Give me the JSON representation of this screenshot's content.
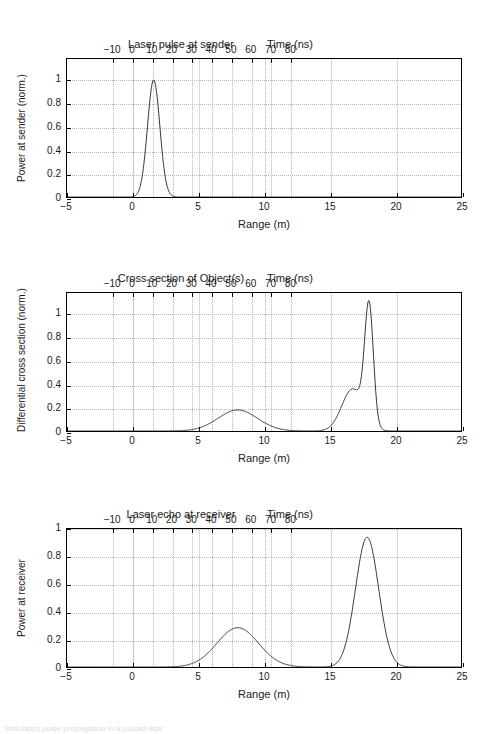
{
  "figure": {
    "caption_fragment": "Simulated pulse propagation in a pulsed lidar"
  },
  "panels": [
    {
      "id": "panel-sender",
      "title": "Laser pulse at sender",
      "top_axis_label": "Time (ns)",
      "bottom_axis_label": "Range (m)",
      "ylabel": "Power at sender (norm.)",
      "top_ticks": [
        "-10",
        "0",
        "10",
        "20",
        "30",
        "40",
        "50",
        "60",
        "70",
        "80"
      ],
      "bottom_ticks": [
        "-5",
        "0",
        "5",
        "10",
        "15",
        "20",
        "25"
      ],
      "y_ticks": [
        "0",
        "0.2",
        "0.4",
        "0.6",
        "0.8",
        "1"
      ]
    },
    {
      "id": "panel-cross-section",
      "title": "Cross section of Object(s)",
      "top_axis_label": "Time (ns)",
      "bottom_axis_label": "Range (m)",
      "ylabel": "Differential cross section (norm.)",
      "top_ticks": [
        "-10",
        "0",
        "10",
        "20",
        "30",
        "40",
        "50",
        "60",
        "70",
        "80"
      ],
      "bottom_ticks": [
        "-5",
        "0",
        "5",
        "10",
        "15",
        "20",
        "25"
      ],
      "y_ticks": [
        "0",
        "0.2",
        "0.4",
        "0.6",
        "0.8",
        "1"
      ]
    },
    {
      "id": "panel-receiver",
      "title": "Laser echo at receiver",
      "top_axis_label": "Time (ns)",
      "bottom_axis_label": "Range (m)",
      "ylabel": "Power at receiver",
      "top_ticks": [
        "-10",
        "0",
        "10",
        "20",
        "30",
        "40",
        "50",
        "60",
        "70",
        "80"
      ],
      "bottom_ticks": [
        "-5",
        "0",
        "5",
        "10",
        "15",
        "20",
        "25"
      ],
      "y_ticks": [
        "0",
        "0.2",
        "0.4",
        "0.6",
        "0.8",
        "1"
      ]
    }
  ],
  "chart_data": [
    {
      "type": "line",
      "title": "Laser pulse at sender",
      "xlabel": "Range (m)",
      "ylabel": "Power at sender (norm.)",
      "secondary_xlabel": "Time (ns)",
      "xlim": [
        -5,
        25
      ],
      "ylim": [
        0,
        1.18
      ],
      "secondary_xlim": [
        -33.36,
        166.8
      ],
      "grid": true,
      "legend": "none",
      "xticks": [
        -5,
        0,
        5,
        10,
        15,
        20,
        25
      ],
      "yticks": [
        0,
        0.2,
        0.4,
        0.6,
        0.8,
        1
      ],
      "secondary_xticks": [
        -10,
        0,
        10,
        20,
        30,
        40,
        50,
        60,
        70,
        80
      ],
      "series": [
        {
          "name": "Transmitted pulse",
          "color": "#000000",
          "peaks": [
            {
              "center": 1.6,
              "amplitude": 1.0,
              "sigma": 0.47
            }
          ]
        }
      ]
    },
    {
      "type": "line",
      "title": "Cross section of Object(s)",
      "xlabel": "Range (m)",
      "ylabel": "Differential cross section (norm.)",
      "secondary_xlabel": "Time (ns)",
      "xlim": [
        -5,
        25
      ],
      "ylim": [
        0,
        1.18
      ],
      "secondary_xlim": [
        -33.36,
        166.8
      ],
      "grid": true,
      "legend": "none",
      "xticks": [
        -5,
        0,
        5,
        10,
        15,
        20,
        25
      ],
      "yticks": [
        0,
        0.2,
        0.4,
        0.6,
        0.8,
        1
      ],
      "secondary_xticks": [
        -10,
        0,
        10,
        20,
        30,
        40,
        50,
        60,
        70,
        80
      ],
      "series": [
        {
          "name": "Differential cross section",
          "color": "#000000",
          "peaks": [
            {
              "center": 8.0,
              "amplitude": 0.18,
              "sigma": 1.5
            },
            {
              "center": 16.75,
              "amplitude": 0.36,
              "sigma": 0.82
            },
            {
              "center": 18.0,
              "amplitude": 1.0,
              "sigma": 0.33
            }
          ]
        }
      ]
    },
    {
      "type": "line",
      "title": "Laser echo at receiver",
      "xlabel": "Range (m)",
      "ylabel": "Power at receiver",
      "secondary_xlabel": "Time (ns)",
      "xlim": [
        -5,
        25
      ],
      "ylim": [
        0,
        1.0
      ],
      "secondary_xlim": [
        -33.36,
        166.8
      ],
      "grid": true,
      "legend": "none",
      "xticks": [
        -5,
        0,
        5,
        10,
        15,
        20,
        25
      ],
      "yticks": [
        0,
        0.2,
        0.4,
        0.6,
        0.8,
        1
      ],
      "secondary_xticks": [
        -10,
        0,
        10,
        20,
        30,
        40,
        50,
        60,
        70,
        80
      ],
      "series": [
        {
          "name": "Received echo",
          "color": "#000000",
          "peaks": [
            {
              "center": 8.0,
              "amplitude": 0.285,
              "sigma": 1.58
            },
            {
              "center": 17.85,
              "amplitude": 0.94,
              "sigma": 0.88
            }
          ]
        }
      ]
    }
  ]
}
